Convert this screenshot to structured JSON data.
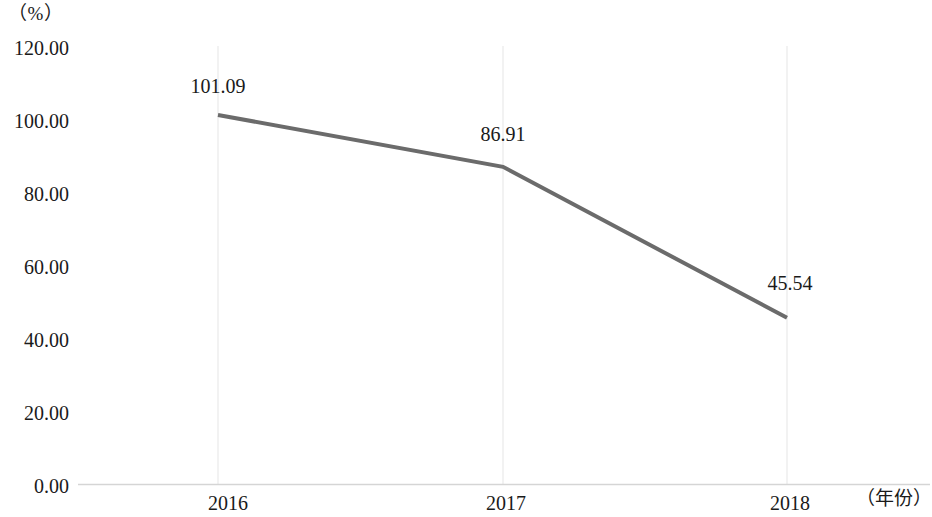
{
  "chart_data": {
    "type": "line",
    "title": "",
    "xlabel": "（年份）",
    "ylabel": "（%）",
    "categories": [
      "2016",
      "2017",
      "2018"
    ],
    "values": [
      101.09,
      86.91,
      45.54
    ],
    "series": [
      {
        "name": "",
        "values": [
          101.09,
          86.91,
          45.54
        ],
        "color": "#6b6b6b"
      }
    ],
    "point_labels": [
      "101.09",
      "86.91",
      "45.54"
    ],
    "ylim": [
      0,
      120
    ],
    "ytick_step": 20,
    "ytick_labels": [
      "120.00",
      "100.00",
      "80.00",
      "60.00",
      "40.00",
      "20.00",
      "0.00"
    ],
    "ytick_values": [
      120,
      100,
      80,
      60,
      40,
      20,
      0
    ],
    "xtick_labels": [
      "2016",
      "2017",
      "2018"
    ],
    "grid": "vertical-light",
    "legend": "none",
    "markers": "none",
    "line_width_px": 4,
    "colors": {
      "line": "#6b6b6b",
      "axis": "#d9d9d9",
      "gridline": "#ededed",
      "text": "#1a1a1a",
      "background": "#ffffff"
    }
  }
}
